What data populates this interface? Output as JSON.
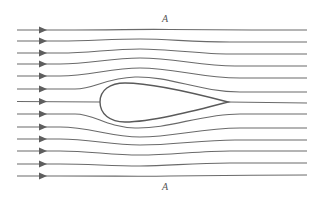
{
  "diagram": {
    "type": "streamline flow around a teardrop (streamlined) body",
    "labels": {
      "top": "A",
      "bottom": "A"
    },
    "streamline_count": 13,
    "streamline_inlet_y": [
      30,
      41,
      53,
      64,
      76,
      89,
      101,
      114,
      127,
      139,
      151,
      164,
      176
    ],
    "arrow_x": 43,
    "inlet_x": 17,
    "outlet_x": 307,
    "body": {
      "shape": "teardrop",
      "leading_edge": [
        100,
        102
      ],
      "trailing_edge": [
        228,
        102
      ],
      "max_thickness_top_y": 83,
      "max_thickness_bottom_y": 122
    },
    "colors": {
      "line": "#6a6a6a",
      "body_outline": "#5a5a5a",
      "arrow": "#5e5e5e",
      "background": "#ffffff"
    }
  }
}
